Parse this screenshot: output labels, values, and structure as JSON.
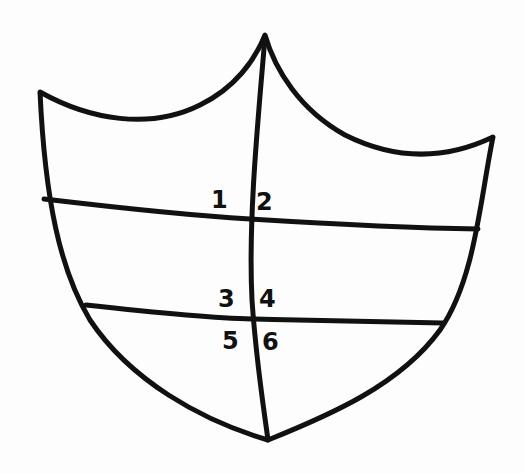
{
  "diagram": {
    "type": "shield",
    "stroke_color": "#111111",
    "background_color": "#fdfdfd",
    "labels": [
      {
        "id": "1",
        "text": "1",
        "x": 211,
        "y": 191
      },
      {
        "id": "2",
        "text": "2",
        "x": 256,
        "y": 193
      },
      {
        "id": "3",
        "text": "3",
        "x": 211,
        "y": 291
      },
      {
        "id": "4",
        "text": "4",
        "x": 259,
        "y": 291
      },
      {
        "id": "5",
        "text": "5",
        "x": 222,
        "y": 333
      },
      {
        "id": "6",
        "text": "6",
        "x": 262,
        "y": 333
      }
    ]
  }
}
